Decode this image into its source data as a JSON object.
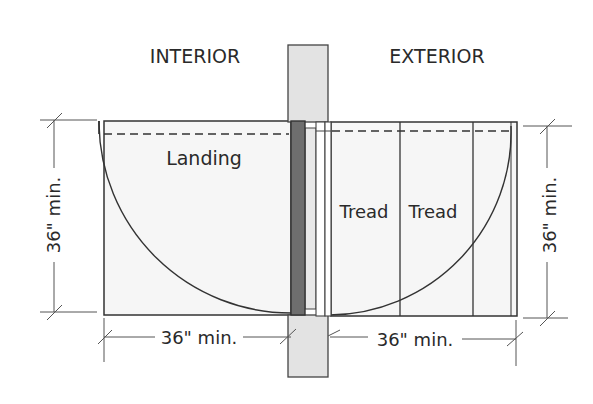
{
  "title_labels": {
    "interior": "INTERIOR",
    "exterior": "EXTERIOR"
  },
  "areas": {
    "landing": "Landing",
    "tread_1": "Tread",
    "tread_2": "Tread"
  },
  "dimensions": {
    "interior_depth": "36\" min.",
    "interior_width": "36\" min.",
    "exterior_depth": "36\" min.",
    "exterior_width": "36\" min."
  },
  "colors": {
    "wall_fill": "#e3e3e3",
    "door_fill": "#6e6e6e",
    "floor_fill": "#f6f6f6",
    "line": "#333333"
  }
}
